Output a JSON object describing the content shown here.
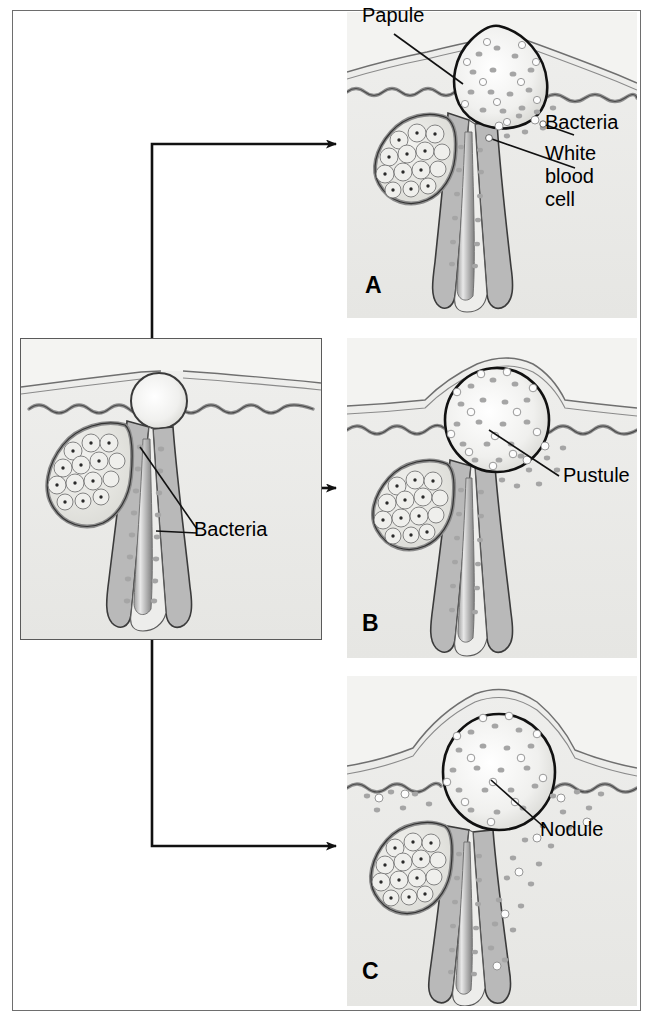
{
  "center_panel": {
    "name": "Blocked follicle with bacteria",
    "labels": {
      "bacteria": "Bacteria"
    }
  },
  "panels": [
    {
      "letter": "A",
      "lesion": "Papule",
      "labels": {
        "lesion": "Papule",
        "bacteria": "Bacteria",
        "white_blood_cell": "White\nblood\ncell"
      }
    },
    {
      "letter": "B",
      "lesion": "Pustule",
      "labels": {
        "lesion": "Pustule"
      }
    },
    {
      "letter": "C",
      "lesion": "Nodule",
      "labels": {
        "lesion": "Nodule"
      }
    }
  ],
  "colors": {
    "tissue_bg": "#f3f3f1",
    "dermis": "#e9e9e6",
    "follicle_wall": "#8c8c8c",
    "follicle_fill": "#bdbdbd",
    "gland_fill": "#e2e2de",
    "bacteria": "#9a9a9a",
    "white_cell": "#fdfdfd",
    "outline": "#1a1a1a",
    "frame": "#6e6e6e"
  }
}
